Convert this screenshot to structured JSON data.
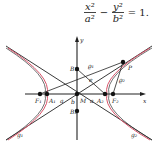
{
  "formula": {
    "term1_num": "x²",
    "term1_den": "a²",
    "minus": "−",
    "term2_num": "y²",
    "term2_den": "b²",
    "equals": "= 1."
  },
  "diagram": {
    "axis_x_label": "x",
    "axis_y_label": "y",
    "points": {
      "F1": "F₁",
      "A1": "A₁",
      "A2": "A₂",
      "F2": "F₂",
      "B1": "B₁",
      "B2": "B₂",
      "M": "M",
      "P": "P"
    },
    "segment_labels": {
      "a_left": "a",
      "a_right": "a",
      "b": "b",
      "e": "e",
      "rho1": "ϱ₁",
      "rho2": "ϱ₂"
    },
    "asymptote_labels": {
      "g1": "g₁",
      "g2": "g₂"
    },
    "colors": {
      "curve": "#d9536a",
      "lines": "#222222"
    }
  }
}
